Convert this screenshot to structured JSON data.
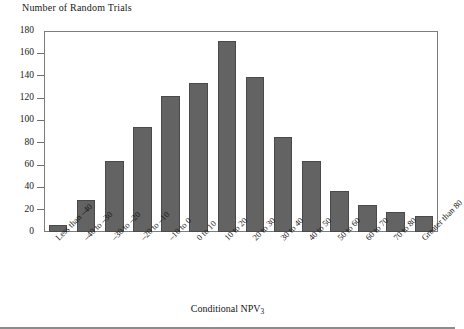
{
  "chart_data": {
    "type": "bar",
    "title": "",
    "ylabel": "Number of Random Trials",
    "xlabel": "Conditional NPV",
    "xlabel_subscript": "3",
    "ylim": [
      0,
      180
    ],
    "yticks": [
      0,
      20,
      40,
      60,
      80,
      100,
      120,
      140,
      160,
      180
    ],
    "grid": false,
    "legend": null,
    "bar_color": "#636363",
    "categories": [
      "Less than –40",
      "–40 to –30",
      "–30 to –20",
      "–20 to –10",
      "–10 to 0",
      "0 to 10",
      "10 to 20",
      "20 to 30",
      "30 to 40",
      "40 to 50",
      "50 to 60",
      "60 to 70",
      "70 to 80",
      "Greater than 80"
    ],
    "values": [
      6,
      29,
      64,
      94,
      122,
      133,
      171,
      139,
      85,
      64,
      37,
      24,
      18,
      14
    ]
  }
}
